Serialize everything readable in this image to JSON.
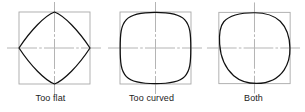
{
  "figure": {
    "background_color": "#ffffff",
    "curve_color": "#101010",
    "box_color": "#a8a8a8",
    "centerline_color": "#b4b4b4",
    "label_color": "#1b1b1b"
  },
  "panels": [
    {
      "id": "panel-too-flat",
      "label": "Too flat",
      "box": {
        "x": 19,
        "y": 12,
        "width": 71,
        "height": 72
      },
      "center": {
        "x": 54.5,
        "y": 48
      },
      "centerline_h": {
        "x1": 7,
        "x2": 101,
        "y": 48
      },
      "centerline_v": {
        "y1": 2,
        "y2": 94,
        "x": 54.5
      },
      "shape": "flat-sided-squircle",
      "description": "Closed curve touching the square at the four mid-points with flat, nearly straight sides bulging only slightly outward"
    },
    {
      "id": "panel-too-curved",
      "label": "Too curved",
      "box": {
        "x": 120,
        "y": 12,
        "width": 71,
        "height": 72
      },
      "center": {
        "x": 155.5,
        "y": 48
      },
      "centerline_h": {
        "x1": 108,
        "x2": 202,
        "y": 48
      },
      "centerline_v": {
        "y1": 2,
        "y2": 94,
        "x": 155.5
      },
      "shape": "rounded-square",
      "description": "Closed curve nearly filling the square with only the corners rounded, i.e. sides are too straight / radius too large"
    },
    {
      "id": "panel-both",
      "label": "Both",
      "box": {
        "x": 219,
        "y": 12,
        "width": 72,
        "height": 72
      },
      "center": {
        "x": 255,
        "y": 48
      },
      "centerline_h": {
        "x1": 207,
        "x2": 301,
        "y": 48
      },
      "centerline_v": {
        "y1": 2,
        "y2": 94,
        "x": 255
      },
      "shape": "asymmetric-lobed",
      "description": "Closed curve that is too curved on the upper-left and right lobes and too flat on the lower-left, combining both errors"
    }
  ]
}
